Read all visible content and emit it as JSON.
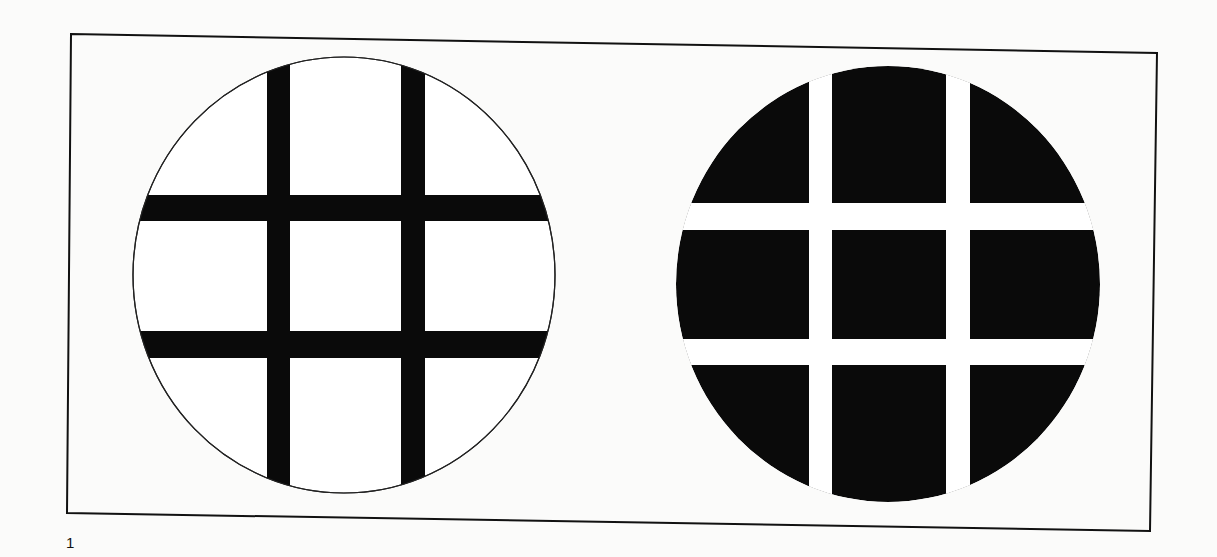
{
  "page": {
    "number": "1",
    "background": "#fbfbfa",
    "ink": "#0a0a0a"
  },
  "figure": {
    "frame": {
      "points": "71,34 1157,53 1150,531 67,513"
    },
    "panels": [
      {
        "name": "white-disc-black-grid",
        "description": "White circle with black 3x3 grid lines",
        "circle": {
          "cx": 344,
          "cy": 275,
          "rx": 211,
          "ry": 218
        },
        "vertical_bars": [
          {
            "x": 267,
            "width": 23
          },
          {
            "x": 401,
            "width": 24
          }
        ],
        "horizontal_bars": [
          {
            "y": 195,
            "height": 26
          },
          {
            "y": 331,
            "height": 27
          }
        ]
      },
      {
        "name": "black-disc-white-grid",
        "description": "Black circle cut into 9 segments by white grid gaps",
        "circle": {
          "cx": 888,
          "cy": 284,
          "rx": 212,
          "ry": 218
        },
        "vertical_gaps": [
          {
            "x": 809,
            "width": 23
          },
          {
            "x": 946,
            "width": 24
          }
        ],
        "horizontal_gaps": [
          {
            "y": 203,
            "height": 27
          },
          {
            "y": 339,
            "height": 26
          }
        ]
      }
    ]
  }
}
